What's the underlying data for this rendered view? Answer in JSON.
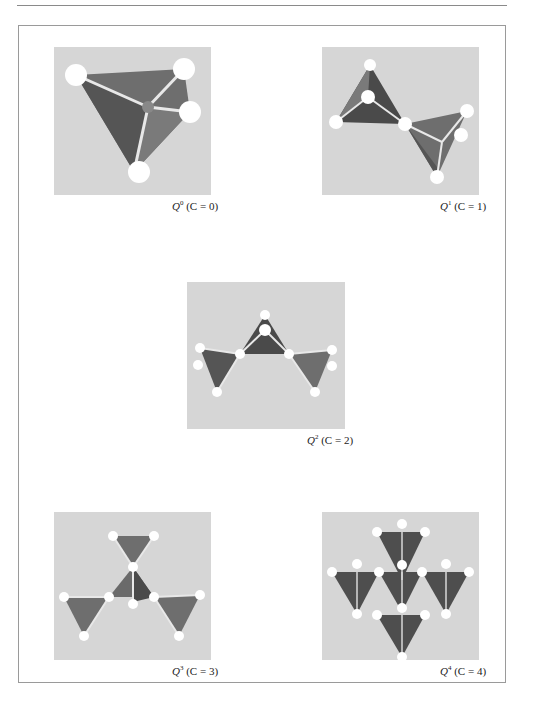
{
  "figure": {
    "panels": [
      {
        "id": "q0",
        "symbol": "Q",
        "superscript": "0",
        "condition": "(C = 0)",
        "connectivity": 0
      },
      {
        "id": "q1",
        "symbol": "Q",
        "superscript": "1",
        "condition": "(C = 1)",
        "connectivity": 1
      },
      {
        "id": "q2",
        "symbol": "Q",
        "superscript": "2",
        "condition": "(C = 2)",
        "connectivity": 2
      },
      {
        "id": "q3",
        "symbol": "Q",
        "superscript": "3",
        "condition": "(C = 3)",
        "connectivity": 3
      },
      {
        "id": "q4",
        "symbol": "Q",
        "superscript": "4",
        "condition": "(C = 4)",
        "connectivity": 4
      }
    ],
    "colors": {
      "image_background": "#d6d6d6",
      "tetrahedron_face": "#6e6e6e",
      "tetrahedron_dark": "#4a4a4a",
      "atom": "#ffffff",
      "frame": "#9a9a9a"
    }
  }
}
